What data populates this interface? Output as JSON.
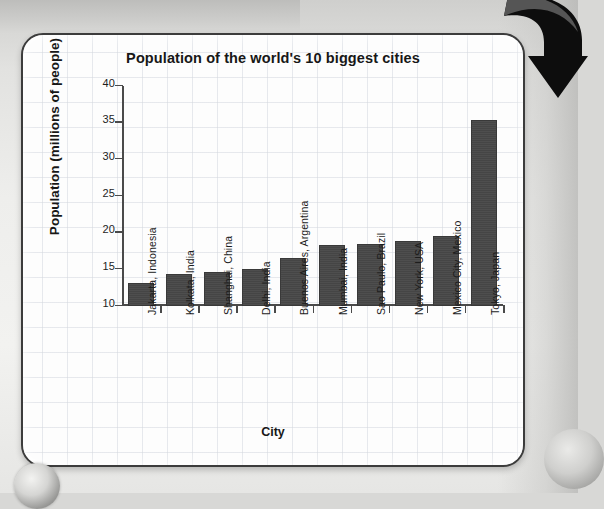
{
  "chart_data": {
    "type": "bar",
    "title": "Population of the world's 10 biggest cities",
    "xlabel": "City",
    "ylabel": "Population (millions of people)",
    "categories": [
      "Jakarta, Indonesia",
      "Kolkata, India",
      "Shanghai, China",
      "Delhi, India",
      "Buenos Aires, Argentina",
      "Mumbai, India",
      "Sao Paulo, Brazil",
      "New York, USA",
      "Mexico City, Mexico",
      "Tokyo, Japan"
    ],
    "values": [
      13.2,
      14.4,
      14.6,
      15.0,
      16.6,
      18.3,
      18.4,
      18.9,
      19.5,
      35.4
    ],
    "ylim": [
      10,
      40
    ],
    "yticks": [
      10,
      15,
      20,
      25,
      30,
      35,
      40
    ],
    "ytick_labels": [
      "10",
      "15",
      "20",
      "25",
      "30",
      "35",
      "40"
    ],
    "grid": true,
    "legend": "none",
    "bar_color": "#4a4a4a",
    "axis_color": "#4a4a4a"
  },
  "page": {
    "card_border_color": "#3c3c3c",
    "card_background": "#fdfdfd",
    "background_color": "#e2e2e0"
  },
  "decorations": {
    "arrow_name": "curved-down-right-arrow",
    "arrow_color": "#0d0d0d"
  }
}
